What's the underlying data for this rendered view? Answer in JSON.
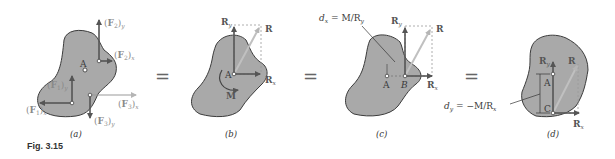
{
  "figure": {
    "label": "Fig. 3.15",
    "colors": {
      "body_fill": "#a9a9a9",
      "body_stroke": "#3c3c3c",
      "vector_dark": "#555555",
      "vector_light": "#b5b5b5",
      "dashed": "#9a9a9a"
    },
    "equals_sign": "=",
    "panels": [
      {
        "id": "a",
        "caption": "(a)",
        "point_label": "A",
        "forces": [
          {
            "label": "(F₂)y",
            "main": "(F",
            "sub": "2",
            "axis": "y"
          },
          {
            "label": "(F₂)x",
            "main": "(F",
            "sub": "2",
            "axis": "x"
          },
          {
            "label": "(F₁)y",
            "main": "(F",
            "sub": "1",
            "axis": "y"
          },
          {
            "label": "(F₁)x",
            "main": "(F",
            "sub": "1",
            "axis": "x"
          },
          {
            "label": "(F₃)x",
            "main": "(F",
            "sub": "3",
            "axis": "x"
          },
          {
            "label": "(F₃)y",
            "main": "(F",
            "sub": "3",
            "axis": "y"
          }
        ]
      },
      {
        "id": "b",
        "caption": "(b)",
        "point_label": "A",
        "vectors": {
          "ry": "R",
          "ry_sub": "y",
          "r": "R",
          "rx": "R",
          "rx_sub": "x"
        },
        "moment_label": "M"
      },
      {
        "id": "c",
        "caption": "(c)",
        "points": [
          "A",
          "B"
        ],
        "vectors": {
          "ry": "R",
          "ry_sub": "y",
          "r": "R",
          "rx": "R",
          "rx_sub": "x"
        },
        "distance_eq": {
          "var": "d",
          "sub": "x",
          "rhs": " = M/R",
          "rhs_sub": "y"
        }
      },
      {
        "id": "d",
        "caption": "(d)",
        "points": [
          "A",
          "C"
        ],
        "vectors": {
          "ry": "R",
          "ry_sub": "y",
          "r": "R",
          "rx": "R",
          "rx_sub": "x"
        },
        "distance_eq": {
          "var": "d",
          "sub": "y",
          "rhs": " = −M/R",
          "rhs_sub": "x"
        }
      }
    ]
  }
}
